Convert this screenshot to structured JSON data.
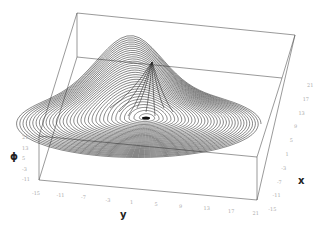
{
  "chart_data": {
    "type": "line3d",
    "title": "",
    "axes": {
      "x": {
        "label": "x",
        "ticks": [
          "21",
          "17",
          "13",
          "9",
          "5",
          "1",
          "-3",
          "-7",
          "-11",
          "-15"
        ]
      },
      "y": {
        "label": "y",
        "ticks": [
          "-15",
          "-11",
          "-7",
          "-3",
          "1",
          "5",
          "9",
          "13",
          "17",
          "21"
        ]
      },
      "phi": {
        "label": "ϕ",
        "ticks": [
          "21",
          "13",
          "5",
          "-3",
          "-11"
        ]
      }
    },
    "grid": false,
    "legend": null,
    "features": {
      "spiral_center_px": [
        146,
        118
      ],
      "peak_px": [
        152,
        62
      ]
    }
  },
  "labels": {
    "x_axis": "x",
    "y_axis": "y",
    "phi_axis": "ϕ"
  }
}
